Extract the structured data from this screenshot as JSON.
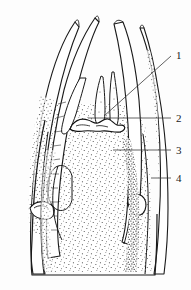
{
  "figure": {
    "type": "scientific-line-drawing",
    "background_color": "#fdfdfd",
    "ink_color": "#1a1a1a",
    "stipple_color": "#2b2b2b",
    "width": 191,
    "height": 290,
    "caption": "",
    "labels": [
      {
        "id": "1",
        "text": "1",
        "x": 176,
        "y": 59,
        "leader_from_x": 171,
        "leader_from_y": 56,
        "leader_to_x": 104,
        "leader_to_y": 116
      },
      {
        "id": "2",
        "text": "2",
        "x": 176,
        "y": 122,
        "leader_from_x": 171,
        "leader_from_y": 118,
        "leader_to_x": 88,
        "leader_to_y": 118
      },
      {
        "id": "3",
        "text": "3",
        "x": 176,
        "y": 154,
        "leader_from_x": 171,
        "leader_from_y": 150,
        "leader_to_x": 113,
        "leader_to_y": 150
      },
      {
        "id": "4",
        "text": "4",
        "x": 176,
        "y": 182,
        "leader_from_x": 171,
        "leader_from_y": 178,
        "leader_to_x": 151,
        "leader_to_y": 178
      }
    ]
  }
}
